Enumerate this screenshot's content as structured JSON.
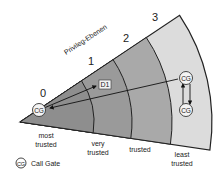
{
  "title": "Privileg-Ebenen",
  "levels": [
    {
      "number": "0",
      "label_line1": "most",
      "label_line2": "trusted",
      "color": "#8c8c8c"
    },
    {
      "number": "1",
      "label_line1": "very",
      "label_line2": "trusted",
      "color": "#999999"
    },
    {
      "number": "2",
      "label_line1": "trusted",
      "label_line2": "",
      "color": "#a8a8a8"
    },
    {
      "number": "3",
      "label_line1": "least",
      "label_line2": "trusted",
      "color": "#dcdcdc"
    }
  ],
  "nodes": {
    "cg_ring0": "CG",
    "d1": "D1",
    "cg_ring3_top": "CG",
    "cg_ring3_bottom": "CG"
  },
  "legend": {
    "icon_text": "CG",
    "label": "Call Gate"
  }
}
